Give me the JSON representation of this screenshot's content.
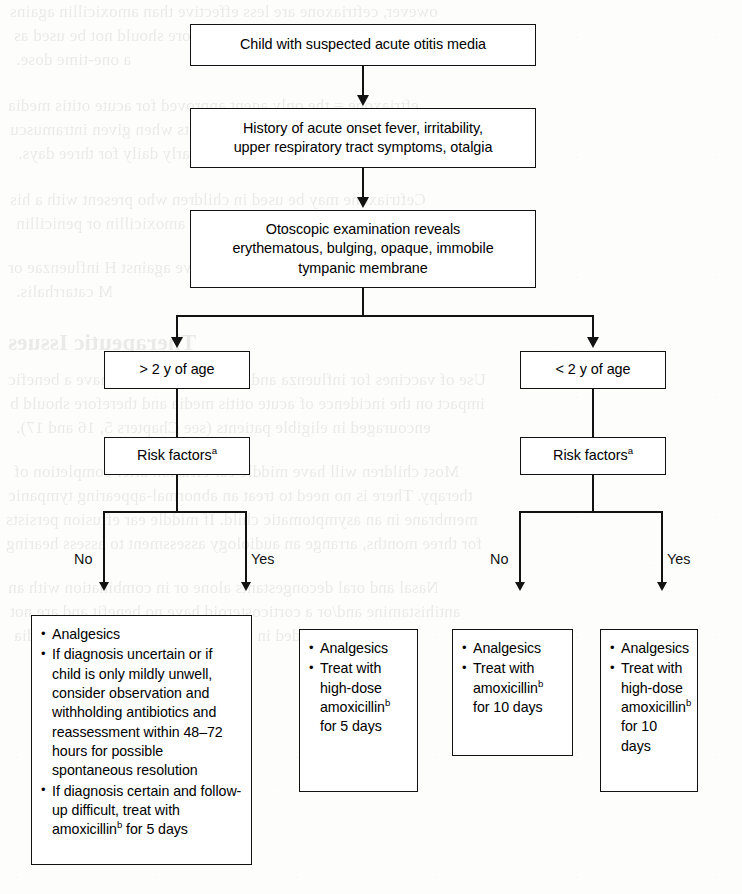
{
  "figure": {
    "type": "clinical-decision-flowchart",
    "orientation": "top-down"
  },
  "nodes": {
    "start": {
      "id": "start",
      "lines": [
        "Child with suspected acute otitis media"
      ]
    },
    "history": {
      "id": "history",
      "lines": [
        "History of acute onset fever, irritability,",
        "upper respiratory tract symptoms, otalgia"
      ]
    },
    "exam": {
      "id": "exam",
      "lines": [
        "Otoscopic examination reveals",
        "erythematous, bulging, opaque, immobile",
        "tympanic membrane"
      ]
    },
    "age_over2": {
      "id": "age-over-2",
      "lines": [
        "> 2 y of age"
      ]
    },
    "age_under2": {
      "id": "age-under-2",
      "lines": [
        "< 2 y of age"
      ]
    },
    "risk_left": {
      "id": "risk-factors-left",
      "label": "Risk factors",
      "footnote": "a"
    },
    "risk_right": {
      "id": "risk-factors-right",
      "label": "Risk factors",
      "footnote": "a"
    }
  },
  "edge_labels": {
    "left_no": "No",
    "left_yes": "Yes",
    "right_no": "No",
    "right_yes": "Yes"
  },
  "outcomes": [
    {
      "id": "outcome-over2-no-risk",
      "branch": "> 2 y of age / Risk factors: No",
      "bullets": [
        {
          "segments": [
            {
              "text": "Analgesics"
            }
          ]
        },
        {
          "segments": [
            {
              "text": "If diagnosis uncertain or if child is only mildly unwell, consider observation and withholding antibiotics and reassessment within 48–72 hours for possible spontaneous resolution"
            }
          ]
        },
        {
          "segments": [
            {
              "text": "If diagnosis certain and follow-up difficult, treat with amoxicillin"
            },
            {
              "footnote": "b"
            },
            {
              "text": " for 5 days"
            }
          ]
        }
      ]
    },
    {
      "id": "outcome-over2-yes-risk",
      "branch": "> 2 y of age / Risk factors: Yes",
      "bullets": [
        {
          "segments": [
            {
              "text": "Analgesics"
            }
          ]
        },
        {
          "segments": [
            {
              "text": "Treat with high-dose amoxicillin"
            },
            {
              "footnote": "b"
            },
            {
              "text": " for 5 days"
            }
          ]
        }
      ]
    },
    {
      "id": "outcome-under2-no-risk",
      "branch": "< 2 y of age / Risk factors: No",
      "bullets": [
        {
          "segments": [
            {
              "text": "Analgesics"
            }
          ]
        },
        {
          "segments": [
            {
              "text": "Treat with amoxicillin"
            },
            {
              "footnote": "b"
            },
            {
              "text": " for 10 days"
            }
          ]
        }
      ]
    },
    {
      "id": "outcome-under2-yes-risk",
      "branch": "< 2 y of age / Risk factors: Yes",
      "bullets": [
        {
          "segments": [
            {
              "text": "Analgesics"
            }
          ]
        },
        {
          "segments": [
            {
              "text": "Treat with high-dose amoxicillin"
            },
            {
              "footnote": "b"
            },
            {
              "text": " for 10 days"
            }
          ]
        }
      ]
    }
  ],
  "colors": {
    "stroke": "#121212",
    "fill": "#ffffff",
    "page": "#fdfdfc",
    "text": "#000000"
  },
  "background_bleed": {
    "note": "faint mirrored show-through text from the reverse side of the printed page",
    "lines": [
      "owever, ceftriaxone are less effective than amoxicillin agains",
      "penicillin-resistant strains and therefore should not be used as",
      "a one-time dose.",
      "eftriaxone = the only agent approved for acute otitis media",
      "media failures but also significant costs when given intramuscu",
      "or intramuscularly daily for three days.",
      "Ceftriaxone may be used in children who present with a his",
      "hypersensitivity reactions to amoxicillin or penicillin",
      "Avoid clindamycin because it is not active against H influenzae or",
      "M catarrhalis.",
      "Therapeutic Issues",
      "Use of vaccines for influenza and S pneumoniae may have a benefic",
      "impact on the incidence of acute otitis media and therefore should b",
      "encouraged in eligible patients (see Chapters 5, 16 and 17).",
      "Most children will have middle ear effusion after completion of",
      "therapy. There is no need to treat an abnormal-appearing tympanic",
      "membrane in an asymptomatic child. If middle ear effusion persists",
      "for three months, arrange an audiology assessment to assess hearing",
      "Nasal and oral decongestants alone or in combination with an",
      "antihistamine and/or a corticosteroid have no benefit and are not",
      "recommended in the treatment of acute otitis media"
    ]
  }
}
